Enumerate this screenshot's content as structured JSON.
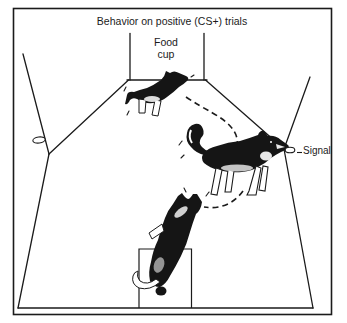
{
  "title": "Behavior on positive (CS+) trials",
  "labels": {
    "food_cup": {
      "line1": "Food",
      "line2": "cup"
    },
    "signal": "Signal"
  },
  "colors": {
    "ink": "#1b1b1b",
    "background": "#ffffff"
  },
  "scene": {
    "chamber": "test-chamber-perspective-view",
    "dogs": [
      "dog-at-food-cup",
      "dog-touching-signal",
      "dog-on-start-platform"
    ],
    "movement_path": "dashed-movement-path",
    "wall_fixtures": [
      "left-wall-disk",
      "signal-disk"
    ]
  }
}
